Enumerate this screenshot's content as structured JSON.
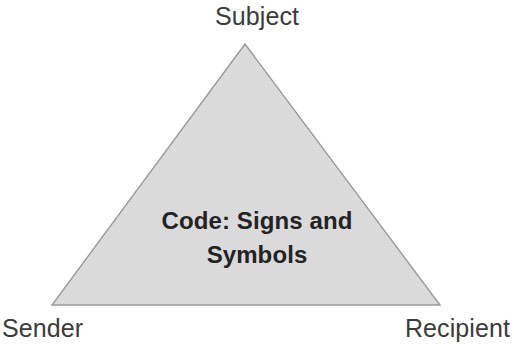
{
  "diagram": {
    "type": "triangle-diagram",
    "background_color": "#ffffff",
    "shape": {
      "name": "triangle",
      "fill_color": "#dcdcdc",
      "stroke_color": "#9a9a9a",
      "stroke_width": 1.4,
      "vertices": {
        "apex": {
          "x": 245,
          "y": 44
        },
        "bottom_left": {
          "x": 52,
          "y": 305
        },
        "bottom_right": {
          "x": 440,
          "y": 305
        }
      }
    },
    "corner_labels": {
      "top": "Subject",
      "bottom_left": "Sender",
      "bottom_right": "Recipient"
    },
    "corner_label_color": "#3b3b3b",
    "center_text": {
      "color": "#232323",
      "lines": [
        "Code: Signs and",
        "Symbols"
      ]
    }
  }
}
